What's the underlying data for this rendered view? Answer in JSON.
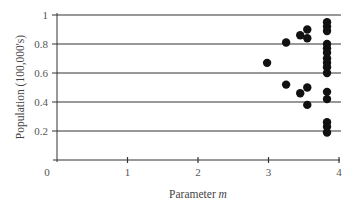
{
  "chart_data": {
    "type": "scatter",
    "title": "",
    "xlabel": "Parameter m",
    "xlabel_main": "Parameter ",
    "xlabel_italic": "m",
    "ylabel": "Population (100,000's)",
    "xlim": [
      0,
      4
    ],
    "ylim": [
      0,
      1
    ],
    "xticks": [
      0,
      1,
      2,
      3,
      4
    ],
    "xtick_labels": [
      "0",
      "1",
      "2",
      "3",
      "4"
    ],
    "yticks": [
      0.2,
      0.4,
      0.6,
      0.8,
      1
    ],
    "ytick_labels": [
      "0.2",
      "0.4",
      "0.6",
      "0.8",
      "1"
    ],
    "grid": "horizontal",
    "legend": null,
    "series": [
      {
        "name": "population",
        "color": "#111111",
        "points": [
          {
            "x": 2.98,
            "y": 0.67
          },
          {
            "x": 3.25,
            "y": 0.81
          },
          {
            "x": 3.25,
            "y": 0.52
          },
          {
            "x": 3.45,
            "y": 0.86
          },
          {
            "x": 3.45,
            "y": 0.46
          },
          {
            "x": 3.55,
            "y": 0.9
          },
          {
            "x": 3.55,
            "y": 0.84
          },
          {
            "x": 3.55,
            "y": 0.5
          },
          {
            "x": 3.55,
            "y": 0.38
          },
          {
            "x": 3.83,
            "y": 0.95
          },
          {
            "x": 3.83,
            "y": 0.92
          },
          {
            "x": 3.83,
            "y": 0.89
          },
          {
            "x": 3.83,
            "y": 0.8
          },
          {
            "x": 3.83,
            "y": 0.77
          },
          {
            "x": 3.83,
            "y": 0.74
          },
          {
            "x": 3.83,
            "y": 0.7
          },
          {
            "x": 3.83,
            "y": 0.67
          },
          {
            "x": 3.83,
            "y": 0.64
          },
          {
            "x": 3.83,
            "y": 0.6
          },
          {
            "x": 3.83,
            "y": 0.47
          },
          {
            "x": 3.83,
            "y": 0.42
          },
          {
            "x": 3.83,
            "y": 0.26
          },
          {
            "x": 3.83,
            "y": 0.23
          },
          {
            "x": 3.83,
            "y": 0.19
          }
        ]
      }
    ]
  },
  "style": {
    "axis_color": "#333333",
    "grid_color": "#333333",
    "point_color": "#111111"
  }
}
